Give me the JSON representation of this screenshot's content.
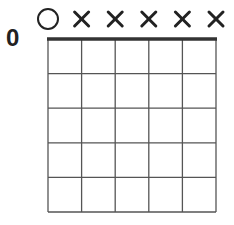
{
  "chord": {
    "fret_label": "0",
    "strings": 6,
    "frets_shown": 5,
    "string_markers": [
      "open",
      "muted",
      "muted",
      "muted",
      "muted",
      "muted"
    ],
    "dots": []
  },
  "colors": {
    "line": "#555555",
    "nut": "#333333",
    "marker": "#222222"
  }
}
